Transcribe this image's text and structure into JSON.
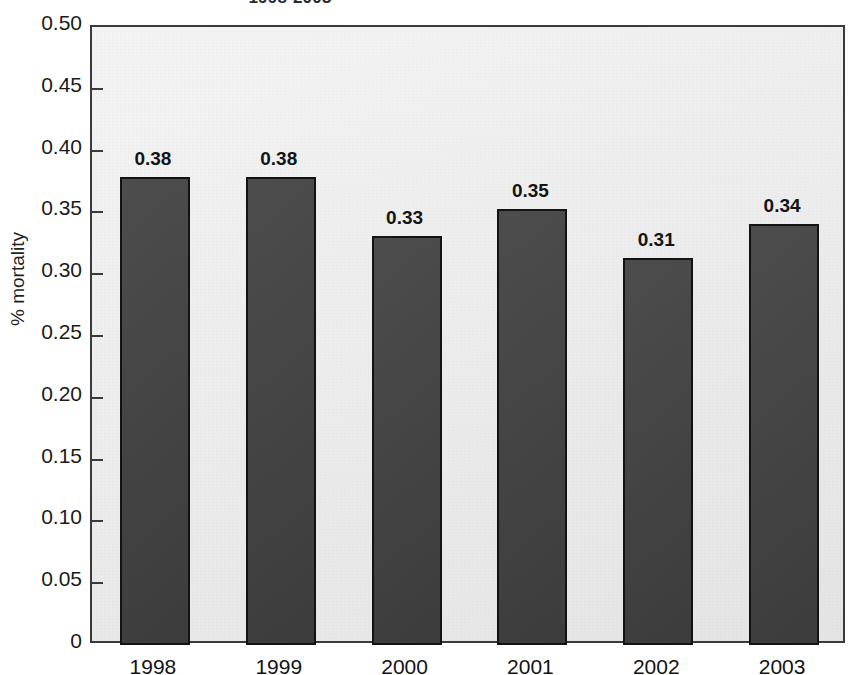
{
  "chart_data": {
    "type": "bar",
    "title": "1998-2003",
    "title_cropped": true,
    "xlabel": "",
    "ylabel": "% mortality",
    "categories": [
      "1998",
      "1999",
      "2000",
      "2001",
      "2002",
      "2003"
    ],
    "values": [
      0.38,
      0.38,
      0.33,
      0.35,
      0.31,
      0.34
    ],
    "data_labels": [
      "0.38",
      "0.38",
      "0.33",
      "0.35",
      "0.31",
      "0.34"
    ],
    "bar_actual_heights": [
      0.379,
      0.379,
      0.331,
      0.353,
      0.313,
      0.341
    ],
    "ylim": [
      0,
      0.5
    ],
    "ytick_values": [
      0,
      0.05,
      0.1,
      0.15,
      0.2,
      0.25,
      0.3,
      0.35,
      0.4,
      0.45,
      0.5
    ],
    "ytick_labels": [
      "0",
      "0.05",
      "0.10",
      "0.15",
      "0.20",
      "0.25",
      "0.30",
      "0.35",
      "0.40",
      "0.45",
      "0.50"
    ],
    "grid": false,
    "legend": null,
    "colors": {
      "bar_fill": "#424242",
      "bar_edge": "#131313",
      "plot_background": "#e9e9e9",
      "axis": "#3a3a3a",
      "text": "#1a1a1a",
      "page_background": "#ffffff"
    }
  }
}
